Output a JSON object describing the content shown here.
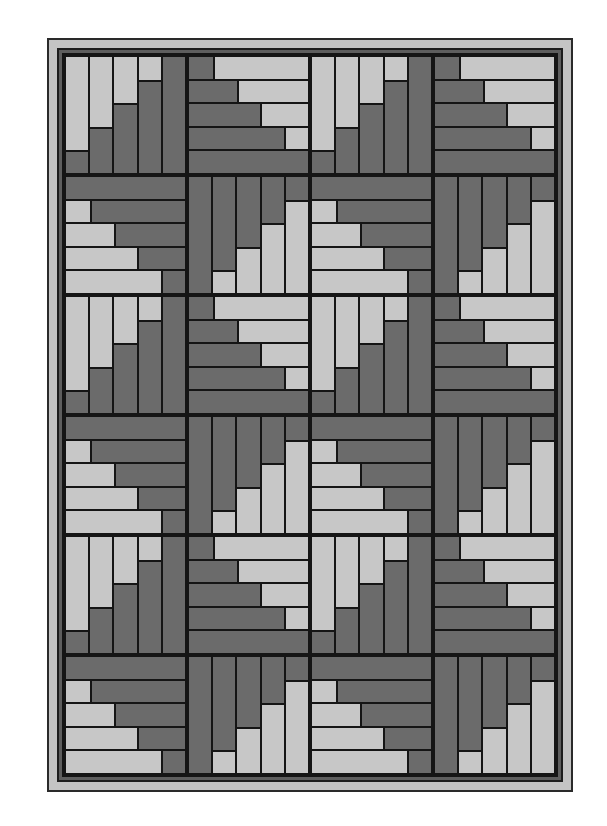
{
  "diagram": {
    "title": "",
    "kind": "log-cabin quilt pattern",
    "grid": {
      "rows": 6,
      "cols": 4
    },
    "colors": {
      "light": "#c7c7c7",
      "dark": "#6b6b6b",
      "outline": "#151515",
      "border_outer": "#c4c4c4",
      "border_inner": "#5e5e5e"
    },
    "block_types": {
      "A": {
        "orientation": "vertical",
        "light_side": "start",
        "light_fifths": [
          4,
          3,
          2,
          1,
          0
        ]
      },
      "B": {
        "orientation": "horizontal",
        "light_side": "end",
        "light_fifths": [
          4,
          3,
          2,
          1,
          0
        ]
      },
      "C": {
        "orientation": "horizontal",
        "light_side": "start",
        "light_fifths": [
          0,
          1,
          2,
          3,
          4
        ]
      },
      "D": {
        "orientation": "vertical",
        "light_side": "end",
        "light_fifths": [
          0,
          1,
          2,
          3,
          4
        ]
      }
    },
    "layout": [
      [
        "A",
        "B",
        "A",
        "B"
      ],
      [
        "C",
        "D",
        "C",
        "D"
      ],
      [
        "A",
        "B",
        "A",
        "B"
      ],
      [
        "C",
        "D",
        "C",
        "D"
      ],
      [
        "A",
        "B",
        "A",
        "B"
      ],
      [
        "C",
        "D",
        "C",
        "D"
      ]
    ]
  }
}
